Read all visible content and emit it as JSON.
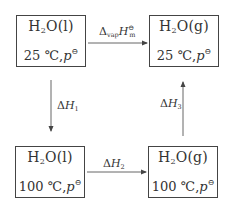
{
  "states": {
    "top_left": {
      "species_prefix": "H",
      "sub": "2",
      "species_suffix": "O(l)",
      "temperature": "25 ℃",
      "pressure": "p",
      "std": "⊖"
    },
    "top_right": {
      "species_prefix": "H",
      "sub": "2",
      "species_suffix": "O(g)",
      "temperature": "25 ℃",
      "pressure": "p",
      "std": "⊖"
    },
    "bottom_left": {
      "species_prefix": "H",
      "sub": "2",
      "species_suffix": "O(l)",
      "temperature": "100 ℃",
      "pressure": "p",
      "std": "⊖"
    },
    "bottom_right": {
      "species_prefix": "H",
      "sub": "2",
      "species_suffix": "O(g)",
      "temperature": "100 ℃",
      "pressure": "p",
      "std": "⊖"
    }
  },
  "arrows": {
    "top": {
      "delta": "Δ",
      "sub": "vap",
      "symbol": "H",
      "sub2": "m",
      "sup": "⊖"
    },
    "left": {
      "delta": "Δ",
      "symbol": "H",
      "sub": "1"
    },
    "bottom": {
      "delta": "Δ",
      "symbol": "H",
      "sub": "2"
    },
    "right": {
      "delta": "Δ",
      "symbol": "H",
      "sub": "3"
    }
  },
  "colors": {
    "line": "#555555",
    "text": "#333333"
  }
}
